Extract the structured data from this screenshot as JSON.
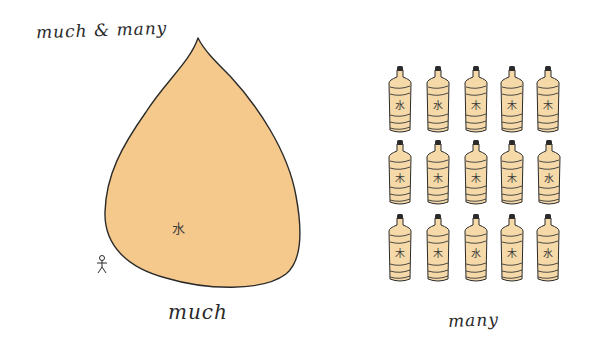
{
  "title": "much & many",
  "labels": {
    "much": "much",
    "many": "many"
  },
  "drop": {
    "glyph": "水",
    "fill": "#f5c98c",
    "stroke": "#2b2b2b"
  },
  "person": {
    "icon": "stick-figure-icon"
  },
  "bottles": {
    "fill": "#f5d9a8",
    "cap": "#2b2b2b",
    "rows": [
      [
        "水",
        "水",
        "木",
        "木",
        "木"
      ],
      [
        "木",
        "木",
        "木",
        "木",
        "水"
      ],
      [
        "木",
        "木",
        "水",
        "木",
        "水"
      ]
    ]
  }
}
